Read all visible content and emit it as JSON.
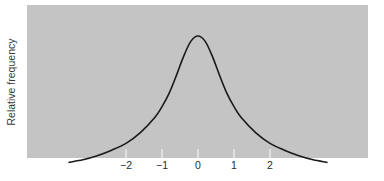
{
  "chart_data": {
    "type": "line",
    "title": "",
    "xlabel": "",
    "ylabel": "Relative frequency",
    "xticks": [
      -2,
      -1,
      0,
      1,
      2
    ],
    "xtick_labels": [
      "−2",
      "−1",
      "0",
      "1",
      "2"
    ],
    "xlim": [
      -3.6,
      3.6
    ],
    "ylim": [
      0,
      1.1
    ],
    "grid": false,
    "legend": null,
    "series": [
      {
        "name": "heavy-tailed distribution (Cauchy-like)",
        "x": [
          -3.6,
          -3.2,
          -2.8,
          -2.4,
          -2.0,
          -1.6,
          -1.2,
          -1.0,
          -0.8,
          -0.6,
          -0.4,
          -0.2,
          0.0,
          0.2,
          0.4,
          0.6,
          0.8,
          1.0,
          1.2,
          1.6,
          2.0,
          2.4,
          2.8,
          3.2,
          3.6
        ],
        "y": [
          0.07,
          0.09,
          0.12,
          0.16,
          0.21,
          0.29,
          0.4,
          0.48,
          0.58,
          0.71,
          0.85,
          0.96,
          1.0,
          0.96,
          0.85,
          0.71,
          0.58,
          0.48,
          0.4,
          0.29,
          0.21,
          0.16,
          0.12,
          0.09,
          0.07
        ]
      }
    ]
  },
  "axis": {
    "ylabel": "Relative frequency",
    "ticks": [
      "−2",
      "−1",
      "0",
      "1",
      "2"
    ]
  }
}
